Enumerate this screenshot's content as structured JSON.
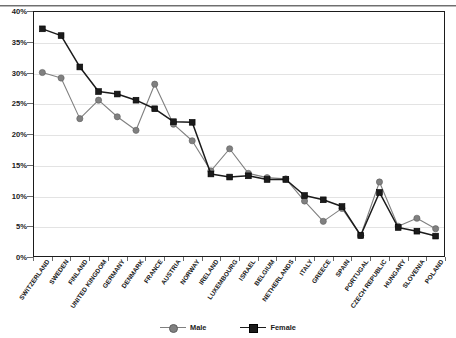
{
  "chart_data": {
    "type": "line",
    "title": "",
    "xlabel": "",
    "ylabel": "",
    "ylim": [
      0,
      40
    ],
    "ytick_step": 5,
    "ytick_labels": [
      "0%",
      "5%",
      "10%",
      "15%",
      "20%",
      "25%",
      "30%",
      "35%",
      "40%"
    ],
    "grid": true,
    "legend_position": "bottom-center",
    "categories": [
      "SWITZERLAND",
      "SWEDEN",
      "FINLAND",
      "UNITED KINGDOM",
      "GERMANY",
      "DENMARK",
      "FRANCE",
      "AUSTRIA",
      "NORWAY",
      "IRELAND",
      "LUXEMBOURG",
      "ISRAEL",
      "BELGIUM",
      "NETHERLANDS",
      "ITALY",
      "GREECE",
      "SPAIN",
      "PORTUGAL",
      "CZECH REPUBLIC",
      "HUNGARY",
      "SLOVENIA",
      "POLAND"
    ],
    "series": [
      {
        "name": "Male",
        "color": "#808080",
        "marker": "circle",
        "values": [
          30.0,
          29.1,
          22.5,
          25.5,
          22.8,
          20.6,
          28.1,
          21.6,
          18.9,
          14.0,
          17.6,
          13.6,
          12.9,
          12.7,
          9.1,
          5.8,
          7.9,
          3.5,
          12.2,
          5.0,
          6.3,
          4.6
        ]
      },
      {
        "name": "Female",
        "color": "#1b1b1b",
        "marker": "square",
        "values": [
          37.1,
          36.0,
          30.9,
          26.9,
          26.5,
          25.5,
          24.1,
          22.0,
          21.9,
          13.5,
          13.0,
          13.2,
          12.6,
          12.6,
          10.0,
          9.3,
          8.2,
          3.5,
          10.5,
          4.8,
          4.2,
          3.4
        ]
      }
    ]
  },
  "legend": {
    "items": [
      {
        "label": "Male"
      },
      {
        "label": "Female"
      }
    ]
  }
}
